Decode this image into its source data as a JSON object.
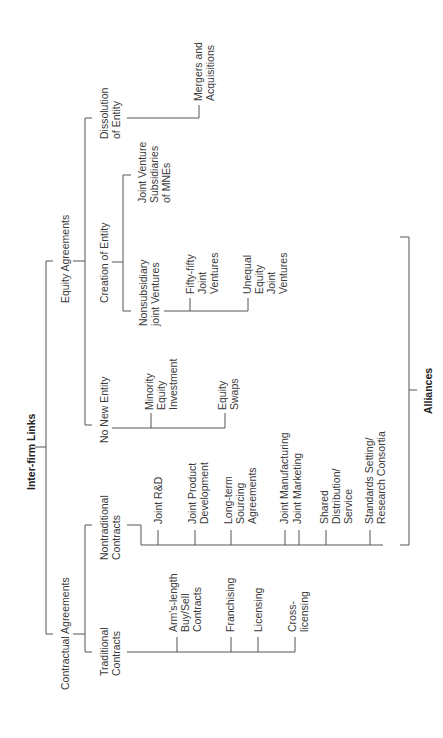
{
  "diagram": {
    "title": "Inter-firm Links",
    "bracket_label": "Alliances",
    "branches": {
      "contractual": {
        "label": "Contractual Agreements",
        "traditional": {
          "label": [
            "Traditional",
            "Contracts"
          ],
          "items": [
            [
              "Arm's-length",
              "Buy/Sell",
              "Contracts"
            ],
            [
              "Franchising"
            ],
            [
              "Licensing"
            ],
            [
              "Cross-",
              "licensing"
            ]
          ]
        },
        "nontraditional": {
          "label": [
            "Nontraditional",
            "Contracts"
          ],
          "items": [
            [
              "Joint R&D"
            ],
            [
              "Joint Product",
              "Development"
            ],
            [
              "Long-term",
              "Sourcing",
              "Agreements"
            ],
            [
              "Joint Manufacturing"
            ],
            [
              "Joint Marketing"
            ],
            [
              "Shared",
              "Distribution/",
              "Service"
            ],
            [
              "Standards Setting/",
              "Research Consortia"
            ]
          ]
        }
      },
      "equity": {
        "label": "Equity Agreements",
        "no_new_entity": {
          "label": "No New Entity",
          "items": [
            [
              "Minority",
              "Equity",
              "Investment"
            ],
            [
              "Equity",
              "Swaps"
            ]
          ]
        },
        "creation": {
          "label": "Creation of Entity",
          "nonsubsidiary": {
            "label": [
              "Nonsubsidiary",
              "joint Ventures"
            ],
            "items": [
              [
                "Fifty-fifty",
                "Joint",
                "Ventures"
              ],
              [
                "Unequal",
                "Equity",
                "Joint",
                "Ventures"
              ]
            ]
          },
          "jv_subsidiaries": [
            "Joint Venture",
            "Subsidiaries",
            "of MNEs"
          ]
        },
        "dissolution": {
          "label": [
            "Dissolution",
            "of Entity"
          ],
          "items": [
            [
              "Mergers and",
              "Acquisitions"
            ]
          ]
        }
      }
    }
  }
}
